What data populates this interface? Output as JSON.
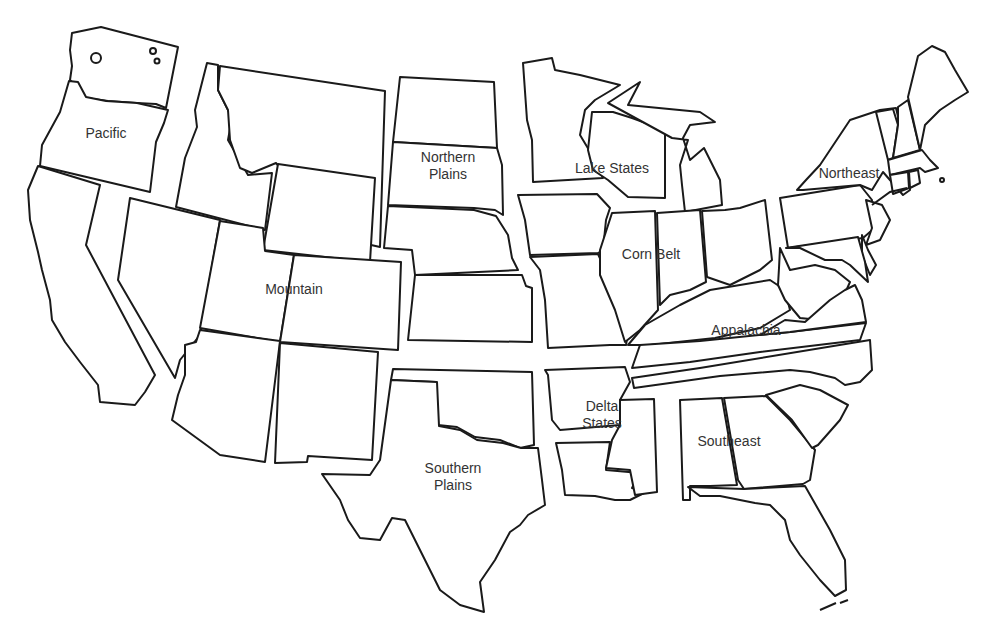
{
  "map": {
    "type": "choropleth-outline",
    "subject": "U.S. farm production regions",
    "background_color": "#ffffff",
    "stroke_color": "#1a1a1a",
    "label_color": "#333333"
  },
  "regions": [
    {
      "id": "pacific",
      "label_lines": [
        "Pacific"
      ],
      "label_x": 106,
      "label_y": 138,
      "states": [
        "WA",
        "OR",
        "CA"
      ]
    },
    {
      "id": "mountain",
      "label_lines": [
        "Mountain"
      ],
      "label_x": 294,
      "label_y": 294,
      "states": [
        "MT",
        "ID",
        "WY",
        "NV",
        "UT",
        "CO",
        "AZ",
        "NM"
      ]
    },
    {
      "id": "northern-plains",
      "label_lines": [
        "Northern",
        "Plains"
      ],
      "label_x": 448,
      "label_y": 170,
      "states": [
        "ND",
        "SD",
        "NE",
        "KS"
      ]
    },
    {
      "id": "lake-states",
      "label_lines": [
        "Lake States"
      ],
      "label_x": 612,
      "label_y": 173,
      "states": [
        "MN",
        "WI",
        "MI"
      ]
    },
    {
      "id": "corn-belt",
      "label_lines": [
        "Corn Belt"
      ],
      "label_x": 651,
      "label_y": 259,
      "states": [
        "IA",
        "MO",
        "IL",
        "IN",
        "OH"
      ]
    },
    {
      "id": "northeast",
      "label_lines": [
        "Northeast"
      ],
      "label_x": 849,
      "label_y": 178,
      "states": [
        "NY",
        "PA",
        "NJ",
        "DE",
        "MD",
        "CT",
        "RI",
        "MA",
        "VT",
        "NH",
        "ME"
      ]
    },
    {
      "id": "appalachia",
      "label_lines": [
        "Appalachia"
      ],
      "label_x": 746,
      "label_y": 335,
      "states": [
        "KY",
        "TN",
        "WV",
        "VA",
        "NC"
      ]
    },
    {
      "id": "southern-plains",
      "label_lines": [
        "Southern",
        "Plains"
      ],
      "label_x": 453,
      "label_y": 481,
      "states": [
        "OK",
        "TX"
      ]
    },
    {
      "id": "delta-states",
      "label_lines": [
        "Delta",
        "States"
      ],
      "label_x": 602,
      "label_y": 419,
      "states": [
        "AR",
        "LA",
        "MS"
      ]
    },
    {
      "id": "southeast",
      "label_lines": [
        "Southeast"
      ],
      "label_x": 729,
      "label_y": 446,
      "states": [
        "AL",
        "GA",
        "SC",
        "FL"
      ]
    }
  ],
  "shapes": [
    {
      "id": "WA",
      "d": "M72,33 L101,27 L178,47 L166,108 L156,104 L137,103 L108,101 L86,98 L80,91 L70,80 L72,66 L70,50 Z"
    },
    {
      "id": "OR",
      "d": "M69,81 L78,82 L86,97 L106,101 L137,103 L168,110 L164,123 L156,142 L150,192 L40,166 L42,145 L60,112 Z"
    },
    {
      "id": "CA",
      "d": "M38,166 L100,185 L86,245 L155,375 L145,392 L135,405 L100,402 L98,385 L80,362 L65,342 L52,320 L50,300 L42,270 L38,252 L30,220 L28,190 Z"
    },
    {
      "id": "ID",
      "d": "M207,63 L218,65 L218,90 L232,118 L228,140 L248,175 L272,173 L265,230 L176,207 L185,158 L197,127 L195,110 Z"
    },
    {
      "id": "MT",
      "d": "M220,66 L385,91 L380,247 L340,238 L276,163 L252,173 L240,168 L230,140 L228,110 L218,90 Z"
    },
    {
      "id": "WY",
      "d": "M278,164 L375,178 L370,262 L263,250 Z"
    },
    {
      "id": "NV",
      "d": "M130,198 L220,220 L200,335 L180,360 L175,378 L118,280 Z"
    },
    {
      "id": "UT",
      "d": "M220,221 L263,228 L265,251 L294,255 L280,342 L200,328 Z"
    },
    {
      "id": "CO",
      "d": "M294,255 L401,262 L398,350 L280,342 Z"
    },
    {
      "id": "AZ",
      "d": "M200,330 L280,341 L265,462 L220,455 L172,420 L178,395 L185,375 L185,345 L196,342 Z"
    },
    {
      "id": "NM",
      "d": "M280,343 L378,352 L372,460 L308,456 L307,462 L275,463 Z"
    },
    {
      "id": "ND",
      "d": "M400,77 L494,82 L497,148 L393,142 Z"
    },
    {
      "id": "SD",
      "d": "M393,142 L497,148 L502,165 L503,215 L495,210 L474,208 L388,205 Z"
    },
    {
      "id": "NE",
      "d": "M388,206 L474,210 L496,216 L508,235 L512,258 L518,270 L415,275 L412,250 L384,248 Z"
    },
    {
      "id": "KS",
      "d": "M415,275 L522,275 L526,286 L532,288 L532,342 L408,340 Z"
    },
    {
      "id": "MN",
      "d": "M523,63 L552,58 L555,70 L580,75 L620,85 L595,100 L585,110 L580,135 L595,160 L603,178 L533,182 L532,140 L527,120 Z"
    },
    {
      "id": "WI",
      "d": "M592,112 L613,112 L632,118 L665,130 L665,180 L665,198 L628,197 L608,180 L593,170 L588,150 Z"
    },
    {
      "id": "MI",
      "d": "M608,103 L640,82 L628,105 L700,112 L715,122 L690,125 L683,138 L690,160 L704,148 L720,180 L722,205 L685,212 L682,185 L680,165 L688,140 L672,138 Z"
    },
    {
      "id": "IA",
      "d": "M518,195 L597,194 L610,208 L606,220 L603,250 L598,253 L530,255 L525,220 Z"
    },
    {
      "id": "MO",
      "d": "M530,257 L598,254 L612,285 L630,320 L626,345 L610,345 L548,348 L545,300 L540,270 Z"
    },
    {
      "id": "IL",
      "d": "M612,213 L655,211 L658,310 L640,330 L625,342 L615,310 L600,275 L600,250 Z"
    },
    {
      "id": "IN",
      "d": "M657,213 L700,210 L706,282 L690,290 L670,295 L660,305 Z"
    },
    {
      "id": "OH",
      "d": "M702,211 L725,210 L740,208 L765,200 L772,260 L760,270 L730,285 L707,277 Z"
    },
    {
      "id": "KY",
      "d": "M628,345 L645,325 L680,305 L710,290 L740,285 L770,280 L785,290 L790,310 L760,328 L715,338 L650,345 Z"
    },
    {
      "id": "TN",
      "d": "M640,345 L700,341 L790,332 L866,323 L860,340 L760,352 L690,362 L632,368 Z"
    },
    {
      "id": "WV",
      "d": "M779,268 L780,248 L790,270 L815,265 L835,270 L850,282 L842,300 L820,320 L800,318 L785,300 L778,285 Z"
    },
    {
      "id": "VA",
      "d": "M785,320 L805,322 L830,300 L845,290 L855,285 L862,300 L866,322 L790,332 L760,335 Z"
    },
    {
      "id": "NC",
      "d": "M632,378 L700,368 L870,340 L872,370 L860,382 L845,385 L835,378 L810,372 L790,370 L720,376 L634,388 Z"
    },
    {
      "id": "AR",
      "d": "M545,370 L625,367 L630,382 L620,400 L620,425 L560,430 L552,420 L548,375 Z"
    },
    {
      "id": "LA",
      "d": "M556,443 L610,442 L606,470 L640,473 L632,488 L646,492 L630,500 L615,500 L595,496 L565,495 L562,470 Z"
    },
    {
      "id": "MS",
      "d": "M620,400 L654,399 L657,492 L635,495 L630,470 L606,468 L612,440 L620,425 Z"
    },
    {
      "id": "OK",
      "d": "M393,369 L532,372 L534,445 L520,448 L500,440 L475,437 L457,427 L438,425 L436,382 L391,380 Z"
    },
    {
      "id": "TX",
      "d": "M391,380 L437,382 L439,426 L460,430 L477,440 L503,443 L521,448 L538,448 L542,480 L545,505 L528,515 L520,525 L510,532 L495,560 L480,582 L484,612 L460,605 L440,590 L430,570 L415,540 L405,520 L392,518 L380,540 L360,538 L348,520 L340,500 L322,474 L370,475 L380,460 Z"
    },
    {
      "id": "AL",
      "d": "M680,400 L722,398 L737,485 L710,486 L690,486 L690,500 L683,500 Z"
    },
    {
      "id": "GA",
      "d": "M724,398 L766,396 L790,420 L815,450 L810,480 L803,484 L744,489 L738,480 Z"
    },
    {
      "id": "SC",
      "d": "M766,395 L800,385 L820,390 L848,405 L840,420 L818,445 L812,448 L792,420 Z"
    },
    {
      "id": "FL",
      "d": "M688,487 L744,489 L805,486 L830,530 L845,560 L846,590 L835,596 L820,580 L800,555 L790,540 L785,520 L770,505 L755,503 L740,500 L720,496 L700,496 Z"
    },
    {
      "id": "PA",
      "d": "M780,198 L860,185 L872,200 L870,215 L878,225 L863,238 L788,248 Z"
    },
    {
      "id": "NY",
      "d": "M797,190 L806,180 L820,165 L840,135 L850,120 L880,110 L896,108 L907,155 L910,190 L903,195 L883,172 L872,190 L860,185 L803,190 Z"
    },
    {
      "id": "NJ",
      "d": "M866,200 L882,205 L890,220 L880,240 L866,245 L872,228 Z"
    },
    {
      "id": "DE",
      "d": "M862,235 L868,250 L876,265 L870,275 L862,255 Z"
    },
    {
      "id": "MD",
      "d": "M786,248 L858,237 L865,262 L868,282 L850,265 L842,260 L825,260 L800,248 Z"
    },
    {
      "id": "VT",
      "d": "M876,112 L893,109 L898,125 L893,158 L888,160 Z"
    },
    {
      "id": "NH",
      "d": "M898,107 L908,100 L920,150 L893,158 L898,125 Z"
    },
    {
      "id": "ME",
      "d": "M908,97 L918,56 L932,46 L945,52 L955,70 L968,92 L955,100 L940,110 L925,125 L920,150 Z"
    },
    {
      "id": "MA",
      "d": "M888,160 L922,150 L930,160 L938,168 L925,172 L920,168 L890,175 Z"
    },
    {
      "id": "CT",
      "d": "M890,175 L908,172 L909,188 L893,194 Z"
    },
    {
      "id": "RI",
      "d": "M909,172 L918,170 L920,183 L910,188 Z"
    }
  ],
  "islands": [
    {
      "id": "san-juan-islands",
      "cx": 96,
      "cy": 58,
      "r": 5
    },
    {
      "id": "lake-isle-1",
      "cx": 153,
      "cy": 51,
      "r": 3
    },
    {
      "id": "lake-isle-2",
      "cx": 157,
      "cy": 61,
      "r": 2.5
    },
    {
      "id": "nantucket",
      "cx": 942,
      "cy": 180,
      "r": 2
    },
    {
      "id": "long-island",
      "d": "M872,205 L890,192 L907,188"
    },
    {
      "id": "florida-keys",
      "d": "M820,610 L836,603 M840,603 L848,600"
    }
  ]
}
